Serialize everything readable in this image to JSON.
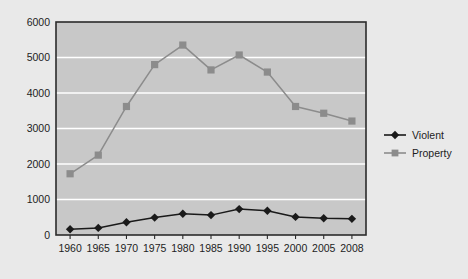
{
  "chart_data": {
    "type": "line",
    "title": "",
    "subtitle": "",
    "xlabel": "",
    "ylabel": "",
    "x": [
      1960,
      1965,
      1970,
      1975,
      1980,
      1985,
      1990,
      1995,
      2000,
      2005,
      2008
    ],
    "categories": [
      "1960",
      "1965",
      "1970",
      "1975",
      "1980",
      "1985",
      "1990",
      "1995",
      "2000",
      "2005",
      "2008"
    ],
    "series": [
      {
        "name": "Violent",
        "color": "#1a1a1a",
        "marker": "diamond",
        "values": [
          160,
          200,
          360,
          490,
          600,
          560,
          730,
          685,
          510,
          470,
          455
        ]
      },
      {
        "name": "Property",
        "color": "#8c8c8c",
        "marker": "square",
        "values": [
          1725,
          2250,
          3620,
          4800,
          5350,
          4650,
          5070,
          4590,
          3620,
          3430,
          3210
        ]
      }
    ],
    "ylim": [
      0,
      6000
    ],
    "ytick_values": [
      0,
      1000,
      2000,
      3000,
      4000,
      5000,
      6000
    ],
    "ytick_labels": [
      "0",
      "1000",
      "2000",
      "3000",
      "4000",
      "5000",
      "6000"
    ],
    "xlim": [
      1960,
      2008
    ],
    "grid": {
      "horizontal": true,
      "vertical": false,
      "color": "#ffffff"
    },
    "legend": {
      "position": "right",
      "entries": [
        {
          "label": "Violent",
          "color": "#1a1a1a",
          "marker": "diamond"
        },
        {
          "label": "Property",
          "color": "#8c8c8c",
          "marker": "square"
        }
      ]
    },
    "plot_area_background": "#c8c8c8",
    "figure_background": "#e9e9e9",
    "axis_color": "#2b2b2b"
  }
}
